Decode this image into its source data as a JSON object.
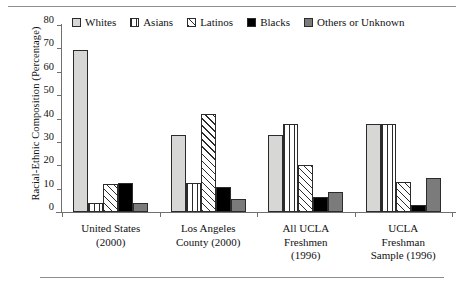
{
  "chart_data": {
    "type": "bar",
    "title": "",
    "xlabel": "",
    "ylabel": "Racial-Ethnic Composition (Percentage)",
    "ylim": [
      0,
      80
    ],
    "yticks": [
      0,
      10,
      20,
      30,
      40,
      50,
      60,
      70,
      80
    ],
    "grid": false,
    "legend_position": "top",
    "categories": [
      "United States (2000)",
      "Los Angeles County (2000)",
      "All UCLA Freshmen (1996)",
      "UCLA Freshman Sample (1996)"
    ],
    "category_lines": [
      [
        "United States",
        "(2000)"
      ],
      [
        "Los Angeles",
        "County (2000)"
      ],
      [
        "All UCLA",
        "Freshmen",
        "(1996)"
      ],
      [
        "UCLA",
        "Freshman",
        "Sample (1996)"
      ]
    ],
    "series": [
      {
        "name": "Whites",
        "pattern": "solid-light",
        "color": "#d7d7d5",
        "values": [
          69.5,
          33.0,
          33.0,
          37.5
        ]
      },
      {
        "name": "Asians",
        "pattern": "vertical-lines",
        "color": "#ffffff",
        "values": [
          4.0,
          12.5,
          37.5,
          37.5
        ]
      },
      {
        "name": "Latinos",
        "pattern": "diagonal-lines",
        "color": "#ffffff",
        "values": [
          12.0,
          42.0,
          20.0,
          13.0
        ]
      },
      {
        "name": "Blacks",
        "pattern": "solid-black",
        "color": "#000000",
        "values": [
          12.5,
          10.5,
          6.5,
          3.0
        ]
      },
      {
        "name": "Others or Unknown",
        "pattern": "solid-gray",
        "color": "#7b7b7b",
        "values": [
          4.0,
          5.5,
          8.5,
          14.5
        ]
      }
    ]
  },
  "legend": {
    "items": [
      {
        "label": "Whites"
      },
      {
        "label": "Asians"
      },
      {
        "label": "Latinos"
      },
      {
        "label": "Blacks"
      },
      {
        "label": "Others or Unknown"
      }
    ]
  },
  "axis": {
    "y_title": "Racial-Ethnic Composition (Percentage)",
    "y_tick_labels": [
      "80",
      "70",
      "60",
      "50",
      "40",
      "30",
      "20",
      "10",
      "0"
    ]
  }
}
